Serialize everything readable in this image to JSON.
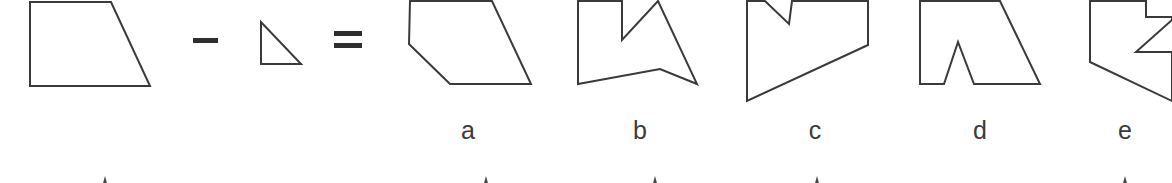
{
  "figure": {
    "background_color": "#ffffff",
    "stroke_color": "#3a3a3a",
    "operator_color": "#2e2e2e",
    "label_color": "#3b3b3b"
  },
  "equation": {
    "minuend": {
      "name": "trapezoid",
      "points": "30,2 111,2 150,86 30,86"
    },
    "minus_operator": {
      "symbol": "−",
      "x": 193,
      "y": 38,
      "width": 25,
      "height": 5
    },
    "subtrahend": {
      "name": "right-triangle",
      "points": "261,22 261,64 301,64"
    },
    "equals_operator": {
      "symbol": "=",
      "x": 334,
      "y_top": 31,
      "y_bottom": 43,
      "width": 28,
      "height": 5
    }
  },
  "choices": [
    {
      "id": "a",
      "label": "a",
      "label_x": 468,
      "label_y": 118,
      "shape_name": "pentagon-clipped-corner",
      "points": "410,1 492,1 531,84 450,84 409,44"
    },
    {
      "id": "b",
      "label": "b",
      "label_x": 640,
      "label_y": 118,
      "shape_name": "concave-notched-polygon",
      "points": "578,1 622,1 622,40 658,1 697,84 660,69 578,84"
    },
    {
      "id": "c",
      "label": "c",
      "label_x": 815,
      "label_y": 118,
      "shape_name": "v-notch-quadrilateral",
      "points": "747,1 765,1 789,24 792,1 868,1 868,45 747,101"
    },
    {
      "id": "d",
      "label": "d",
      "label_x": 980,
      "label_y": 118,
      "shape_name": "trapezoid-with-triangular-cutout",
      "points": "920,1 1000,1 1040,84 974,84 958,42 944,84 920,84"
    },
    {
      "id": "e",
      "label": "e",
      "label_x": 1125,
      "label_y": 118,
      "shape_name": "zigzag-polygon-clipped",
      "points": "1090,1 1146,1 1146,17 1172,17 1172,20 1136,52 1172,52 1172,101 1090,62"
    }
  ],
  "next_row_ticks": [
    {
      "x": 105,
      "y": 176
    },
    {
      "x": 486,
      "y": 176
    },
    {
      "x": 655,
      "y": 176
    },
    {
      "x": 817,
      "y": 176
    },
    {
      "x": 1125,
      "y": 176
    }
  ]
}
